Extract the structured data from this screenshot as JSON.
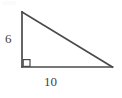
{
  "figure": {
    "kind": "right-triangle-diagram",
    "background_color": "#ffffff",
    "stroke_color": "#4a4a4a",
    "text_color": "#3f3f3f",
    "stroke_width": 1.6,
    "right_angle_marker": {
      "name": "right-angle-square",
      "size": 7,
      "stroke_color": "#4a4a4a"
    },
    "vertices": {
      "apex": {
        "x": 22,
        "y": 12
      },
      "right_angle": {
        "x": 22,
        "y": 67
      },
      "base_right": {
        "x": 112,
        "y": 67
      }
    },
    "labels": {
      "vertical_leg": "6",
      "horizontal_leg": "10"
    }
  }
}
